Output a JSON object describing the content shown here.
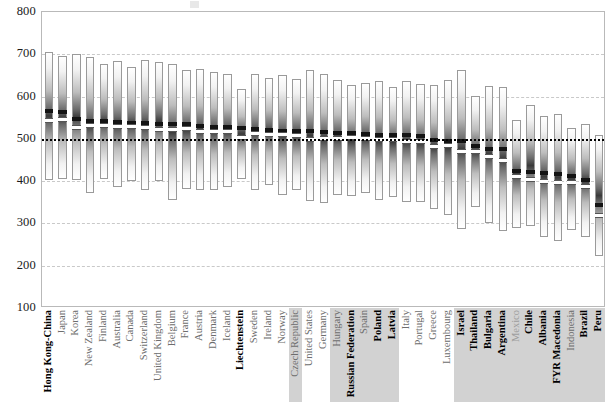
{
  "chart_data": {
    "type": "bar",
    "title": "",
    "subtitle": "",
    "xlabel": "",
    "ylabel": "",
    "ylim": [
      100,
      800
    ],
    "yticks": [
      100,
      200,
      300,
      400,
      500,
      600,
      700,
      800
    ],
    "gridlines": [
      200,
      300,
      400,
      600,
      700
    ],
    "reference_line": 500,
    "grid": true,
    "legend_position": "none",
    "categories": [
      "Hong Kong-China",
      "Japan",
      "Korea",
      "New Zealand",
      "Finland",
      "Australia",
      "Canada",
      "Switzerland",
      "United Kingdom",
      "Belgium",
      "France",
      "Austria",
      "Denmark",
      "Iceland",
      "Liechtenstein",
      "Sweden",
      "Ireland",
      "Norway",
      "Czech Republic",
      "United States",
      "Germany",
      "Hungary",
      "Russian Federation",
      "Spain",
      "Poland",
      "Latvia",
      "Italy",
      "Portugal",
      "Greece",
      "Luxembourg",
      "Israel",
      "Thailand",
      "Bulgaria",
      "Argentina",
      "Mexico",
      "Chile",
      "Albania",
      "FYR Macedonia",
      "Indonesia",
      "Brazil",
      "Peru"
    ],
    "series": [
      {
        "name": "5th percentile",
        "values": [
          403,
          405,
          402,
          372,
          404,
          386,
          400,
          380,
          401,
          355,
          382,
          380,
          378,
          387,
          404,
          380,
          390,
          368,
          378,
          354,
          348,
          367,
          364,
          372,
          356,
          362,
          351,
          350,
          333,
          319,
          287,
          338,
          302,
          282,
          290,
          295,
          268,
          258,
          284,
          268,
          224
        ]
      },
      {
        "name": "Mean score",
        "values": [
          567,
          563,
          546,
          542,
          542,
          539,
          538,
          537,
          536,
          535,
          534,
          530,
          529,
          527,
          526,
          524,
          522,
          519,
          518,
          518,
          516,
          514,
          514,
          512,
          510,
          509,
          509,
          507,
          498,
          496,
          494,
          483,
          476,
          475,
          424,
          422,
          420,
          418,
          413,
          402,
          344
        ]
      },
      {
        "name": "95th percentile",
        "values": [
          706,
          697,
          700,
          694,
          676,
          684,
          671,
          686,
          681,
          676,
          662,
          665,
          658,
          653,
          619,
          653,
          644,
          651,
          642,
          662,
          654,
          639,
          628,
          633,
          637,
          623,
          638,
          630,
          627,
          639,
          663,
          602,
          625,
          623,
          545,
          580,
          553,
          558,
          526,
          536,
          510
        ]
      },
      {
        "name": "Confidence band lower",
        "values": [
          545,
          546,
          527,
          533,
          532,
          531,
          530,
          528,
          524,
          524,
          525,
          519,
          519,
          519,
          505,
          515,
          512,
          511,
          509,
          500,
          501,
          503,
          504,
          501,
          499,
          500,
          494,
          495,
          483,
          486,
          472,
          471,
          459,
          450,
          412,
          406,
          401,
          397,
          398,
          388,
          321
        ]
      }
    ],
    "label_styles": [
      "bold",
      "normal",
      "normal",
      "normal",
      "normal",
      "normal",
      "normal",
      "normal",
      "normal",
      "normal",
      "normal",
      "normal",
      "normal",
      "normal",
      "bold",
      "normal",
      "normal",
      "normal",
      "normal",
      "normal",
      "normal",
      "normal",
      "bold",
      "normal",
      "bold",
      "bold",
      "normal",
      "normal",
      "normal",
      "normal",
      "bold",
      "bold",
      "bold",
      "bold",
      "light",
      "bold",
      "bold",
      "bold",
      "normal",
      "bold",
      "bold"
    ],
    "label_band": [
      false,
      false,
      false,
      false,
      false,
      false,
      false,
      false,
      false,
      false,
      false,
      false,
      false,
      false,
      false,
      false,
      false,
      false,
      true,
      false,
      false,
      true,
      true,
      true,
      true,
      true,
      false,
      false,
      false,
      false,
      true,
      true,
      true,
      true,
      true,
      true,
      true,
      true,
      true,
      true,
      true
    ]
  }
}
